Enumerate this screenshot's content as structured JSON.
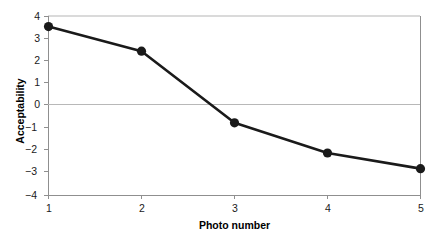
{
  "chart_data": {
    "type": "line",
    "title": "",
    "xlabel": "Photo number",
    "ylabel": "Acceptability",
    "x": [
      1,
      2,
      3,
      4,
      5
    ],
    "values": [
      3.55,
      2.45,
      -0.75,
      -2.1,
      -2.8
    ],
    "series": [
      {
        "name": "Acceptability",
        "values": [
          3.55,
          2.45,
          -0.75,
          -2.1,
          -2.8
        ]
      }
    ],
    "xlim": [
      1,
      5
    ],
    "ylim": [
      -4,
      4
    ],
    "xticks": [
      "1",
      "2",
      "3",
      "4",
      "5"
    ],
    "yticks": [
      "4",
      "3",
      "2",
      "1",
      "0",
      "−1",
      "−2",
      "−3",
      "−4"
    ],
    "ytick_values": [
      4,
      3,
      2,
      1,
      0,
      -1,
      -2,
      -3,
      -4
    ],
    "grid": false,
    "zero_line": true,
    "legend": "none",
    "marker": "filled-circle",
    "line_color": "#1a1a1a",
    "marker_color": "#1a1a1a",
    "axis_color": "#9a9a9a",
    "zero_line_color": "#b0b0b0",
    "background_color": "#ffffff"
  }
}
